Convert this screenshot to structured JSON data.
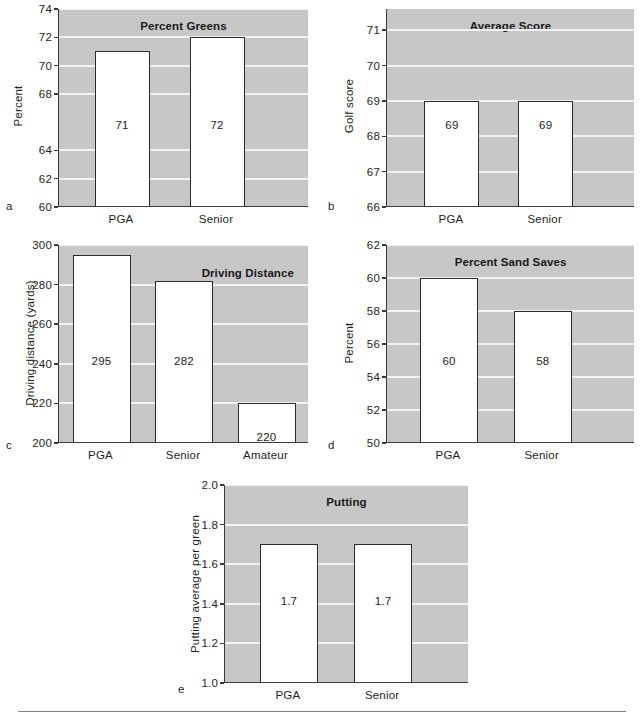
{
  "figure": {
    "panel_letters": [
      "a",
      "b",
      "c",
      "d",
      "e"
    ],
    "background_color": "#c7c7c7",
    "gridline_color": "#f2f2f2",
    "bar_fill": "#ffffff",
    "bar_stroke": "#2b2b2b"
  },
  "chart_data": [
    {
      "id": "a",
      "type": "bar",
      "title": "Percent Greens",
      "xlabel": "",
      "ylabel": "Percent",
      "categories": [
        "PGA",
        "Senior"
      ],
      "values": [
        71,
        72
      ],
      "value_labels": [
        "71",
        "72"
      ],
      "ylim": [
        60,
        74
      ],
      "yticks": [
        60,
        62,
        64,
        66,
        68,
        70,
        72,
        74
      ],
      "ytick_labels": [
        "60",
        "62",
        "64",
        "68",
        "70",
        "72",
        "74"
      ],
      "ytick_values": [
        60,
        62,
        64,
        68,
        70,
        72,
        74
      ],
      "grid": true,
      "legend": "none"
    },
    {
      "id": "b",
      "type": "bar",
      "title": "Average Score",
      "xlabel": "",
      "ylabel": "Golf score",
      "categories": [
        "PGA",
        "Senior"
      ],
      "values": [
        69,
        69
      ],
      "value_labels": [
        "69",
        "69"
      ],
      "ylim": [
        66,
        71.6
      ],
      "yticks": [
        66,
        67,
        68,
        69,
        70,
        71
      ],
      "ytick_labels": [
        "66",
        "67",
        "68",
        "69",
        "70",
        "71"
      ],
      "ytick_values": [
        66,
        67,
        68,
        69,
        70,
        71
      ],
      "grid": true,
      "legend": "none"
    },
    {
      "id": "c",
      "type": "bar",
      "title": "Driving Distance",
      "xlabel": "",
      "ylabel": "Driving distance (yards)",
      "categories": [
        "PGA",
        "Senior",
        "Amateur"
      ],
      "values": [
        295,
        282,
        220
      ],
      "value_labels": [
        "295",
        "282",
        "220"
      ],
      "ylim": [
        200,
        300
      ],
      "yticks": [
        200,
        220,
        240,
        260,
        280,
        300
      ],
      "ytick_labels": [
        "200",
        "220",
        "240",
        "260",
        "280",
        "300"
      ],
      "ytick_values": [
        200,
        220,
        240,
        260,
        280,
        300
      ],
      "grid": true,
      "legend": "none"
    },
    {
      "id": "d",
      "type": "bar",
      "title": "Percent Sand Saves",
      "xlabel": "",
      "ylabel": "Percent",
      "categories": [
        "PGA",
        "Senior"
      ],
      "values": [
        60,
        58
      ],
      "value_labels": [
        "60",
        "58"
      ],
      "ylim": [
        50,
        62
      ],
      "yticks": [
        50,
        52,
        54,
        56,
        58,
        60,
        62
      ],
      "ytick_labels": [
        "50",
        "52",
        "54",
        "56",
        "58",
        "60",
        "62"
      ],
      "ytick_values": [
        50,
        52,
        54,
        56,
        58,
        60,
        62
      ],
      "grid": true,
      "legend": "none"
    },
    {
      "id": "e",
      "type": "bar",
      "title": "Putting",
      "xlabel": "",
      "ylabel": "Putting average per green",
      "categories": [
        "PGA",
        "Senior"
      ],
      "values": [
        1.7,
        1.7
      ],
      "value_labels": [
        "1.7",
        "1.7"
      ],
      "ylim": [
        1.0,
        2.0
      ],
      "yticks": [
        1.0,
        1.2,
        1.4,
        1.6,
        1.8,
        2.0
      ],
      "ytick_labels": [
        "1.0",
        "1.2",
        "1.4",
        "1.6",
        "1.8",
        "2.0"
      ],
      "ytick_values": [
        1.0,
        1.2,
        1.4,
        1.6,
        1.8,
        2.0
      ],
      "grid": true,
      "legend": "none"
    }
  ]
}
